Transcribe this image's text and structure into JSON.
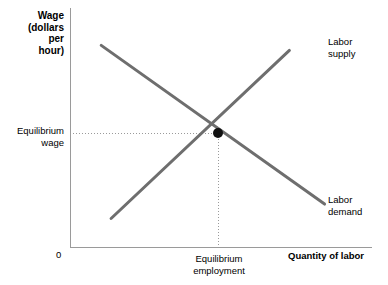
{
  "chart_data": {
    "type": "line",
    "title": "",
    "subtitle": "",
    "ylabel": "Wage\n(dollars\nper\nhour)",
    "xlabel": "Quantity of labor",
    "origin_tick": "0",
    "grid": false,
    "legend_position": "inline-right",
    "annotations": {
      "equilibrium_wage": "Equilibrium\nwage",
      "equilibrium_employment": "Equilibrium\nemployment",
      "equilibrium_point_marker": "filled-circle"
    },
    "series": [
      {
        "name": "Labor\nsupply",
        "label": "Labor\nsupply",
        "slope": "positive",
        "x": [
          0.14,
          1.0
        ],
        "y": [
          0.12,
          0.85
        ],
        "color": "#6e6e6e"
      },
      {
        "name": "Labor\ndemand",
        "label": "Labor\ndemand",
        "slope": "negative",
        "x": [
          0.1,
          1.0
        ],
        "y": [
          0.85,
          0.18
        ],
        "color": "#6e6e6e"
      }
    ],
    "intersection": {
      "x": 0.49,
      "y": 0.48,
      "x_label": "Equilibrium\nemployment",
      "y_label": "Equilibrium\nwage"
    },
    "xlim": [
      0,
      1
    ],
    "ylim": [
      0,
      1
    ],
    "axis_color": "#9a9a9a",
    "guide_color": "#9a9a9a",
    "marker_color": "#111111"
  },
  "figure": {
    "background": "#ffffff",
    "y_axis_title": "Wage\n(dollars\nper\nhour)",
    "x_axis_title": "Quantity of labor",
    "origin": "0",
    "equilibrium_wage_label": "Equilibrium\nwage",
    "equilibrium_employment_label": "Equilibrium\nemployment",
    "supply_label": "Labor\nsupply",
    "demand_label": "Labor\ndemand"
  }
}
